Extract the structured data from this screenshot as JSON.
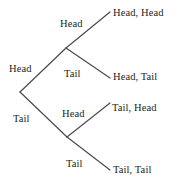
{
  "figure": {
    "name": "coin-toss-probability-tree",
    "type": "tree-diagram",
    "background_color": "#ffffff",
    "line_color": "#4d4a4b",
    "text_color": "#231f20"
  },
  "tree": {
    "root": {
      "x": 20,
      "y": 92
    },
    "nodes": [
      {
        "id": "head-branch",
        "x": 66,
        "y": 48
      },
      {
        "id": "tail-branch",
        "x": 67,
        "y": 137
      }
    ],
    "edge_labels": [
      {
        "id": "edge-root-head",
        "text": "Head",
        "x": 9,
        "y": 63
      },
      {
        "id": "edge-root-tail",
        "text": "Tail",
        "x": 13,
        "y": 113
      },
      {
        "id": "edge-head-head",
        "text": "Head",
        "x": 60,
        "y": 18
      },
      {
        "id": "edge-head-tail",
        "text": "Tail",
        "x": 64,
        "y": 68
      },
      {
        "id": "edge-tail-head",
        "text": "Head",
        "x": 62,
        "y": 108
      },
      {
        "id": "edge-tail-tail",
        "text": "Tail",
        "x": 66,
        "y": 158
      }
    ],
    "leaf_labels": [
      {
        "id": "leaf-head-head",
        "text": "Head, Head",
        "x": 113,
        "y": 7
      },
      {
        "id": "leaf-head-tail",
        "text": "Head, Tail",
        "x": 113,
        "y": 71
      },
      {
        "id": "leaf-tail-head",
        "text": "Tail, Head",
        "x": 112,
        "y": 102
      },
      {
        "id": "leaf-tail-tail",
        "text": "Tail, Tail",
        "x": 113,
        "y": 164
      }
    ],
    "branches": [
      {
        "id": "branch-root-to-head",
        "x1": 20,
        "y1": 92,
        "x2": 66,
        "y2": 48
      },
      {
        "id": "branch-root-to-tail",
        "x1": 20,
        "y1": 92,
        "x2": 67,
        "y2": 137
      },
      {
        "id": "branch-head-to-headhead",
        "x1": 66,
        "y1": 48,
        "x2": 110,
        "y2": 12
      },
      {
        "id": "branch-head-to-headtail",
        "x1": 66,
        "y1": 48,
        "x2": 110,
        "y2": 78
      },
      {
        "id": "branch-tail-to-tailhead",
        "x1": 67,
        "y1": 137,
        "x2": 110,
        "y2": 103
      },
      {
        "id": "branch-tail-to-tailtail",
        "x1": 67,
        "y1": 137,
        "x2": 110,
        "y2": 170
      }
    ]
  }
}
